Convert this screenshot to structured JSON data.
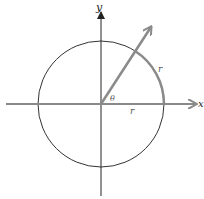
{
  "figure": {
    "labels": {
      "y_axis": "y",
      "x_axis": "x",
      "angle": "θ",
      "arc": "r",
      "radius": "r"
    },
    "colors": {
      "axes": "#333333",
      "circle": "#333333",
      "highlight": "#8a8a8a"
    }
  }
}
